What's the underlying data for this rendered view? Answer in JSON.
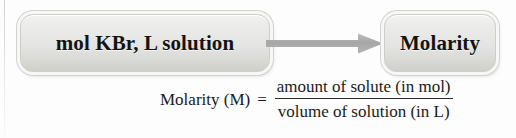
{
  "diagram": {
    "type": "flow",
    "nodes": [
      {
        "id": "given",
        "label": "mol KBr, L solution"
      },
      {
        "id": "result",
        "label": "Molarity"
      }
    ],
    "connector": {
      "kind": "arrow-right-icon",
      "direction": "right",
      "color": "#a9a9a9"
    }
  },
  "formula": {
    "lhs": "Molarity (M)",
    "equals": "=",
    "numerator": "amount of solute (in mol)",
    "denominator": "volume of solution (in L)"
  },
  "colors": {
    "box_fill_top": "#f2f2f0",
    "box_fill_bottom": "#cfcfcb",
    "box_border": "#cdcdc9",
    "arrow": "#a9a9a9",
    "text": "#131313",
    "background": "#fdfdfd"
  }
}
